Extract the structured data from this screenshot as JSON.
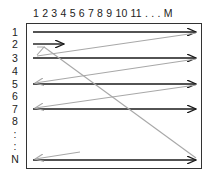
{
  "diagram": {
    "column_header": "1 2 3 4 5 6 7 8 9 10 11 . . .  M",
    "row_labels": [
      {
        "label": "1",
        "y": 32
      },
      {
        "label": "2",
        "y": 44
      },
      {
        "label": "3",
        "y": 58
      },
      {
        "label": "4",
        "y": 71
      },
      {
        "label": "5",
        "y": 84
      },
      {
        "label": "6",
        "y": 96
      },
      {
        "label": "7",
        "y": 109
      },
      {
        "label": "8",
        "y": 121
      },
      {
        "label": ":",
        "y": 134
      },
      {
        "label": ":",
        "y": 146
      },
      {
        "label": "N",
        "y": 159
      }
    ],
    "colors": {
      "forward_arrow": "#1a1a1a",
      "return_arrow": "#a8a8a8",
      "frame": "#333333"
    }
  }
}
